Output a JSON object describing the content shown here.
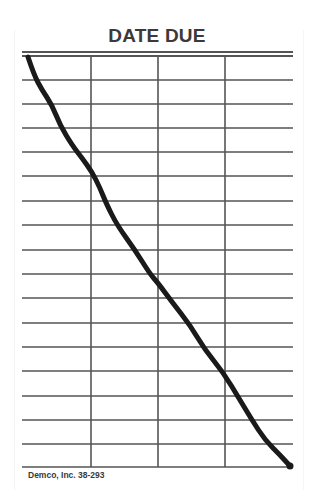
{
  "card": {
    "title": "DATE DUE",
    "footer": "Demco, Inc. 38-293"
  },
  "grid": {
    "left": 22,
    "right": 293,
    "top_double_lines": [
      52,
      56
    ],
    "row_lines_y": [
      80,
      104,
      128,
      152,
      176,
      201,
      225,
      250,
      274,
      298,
      323,
      347,
      371,
      396,
      420,
      444,
      467
    ],
    "column_lines_x": [
      91,
      158,
      225
    ],
    "column_top": 56,
    "column_bottom": 467,
    "row_count": 17,
    "column_count": 4,
    "line_color": "#555555"
  },
  "strike_line": {
    "description": "hand-drawn diagonal line crossing out the card",
    "color": "#1a1a1a",
    "points": [
      [
        28,
        57
      ],
      [
        34,
        75
      ],
      [
        42,
        90
      ],
      [
        52,
        105
      ],
      [
        60,
        125
      ],
      [
        72,
        145
      ],
      [
        82,
        158
      ],
      [
        92,
        172
      ],
      [
        100,
        188
      ],
      [
        106,
        203
      ],
      [
        117,
        225
      ],
      [
        135,
        250
      ],
      [
        150,
        274
      ],
      [
        158,
        283
      ],
      [
        172,
        302
      ],
      [
        190,
        325
      ],
      [
        205,
        350
      ],
      [
        223,
        372
      ],
      [
        240,
        400
      ],
      [
        252,
        420
      ],
      [
        265,
        440
      ],
      [
        280,
        455
      ],
      [
        290,
        466
      ]
    ]
  }
}
